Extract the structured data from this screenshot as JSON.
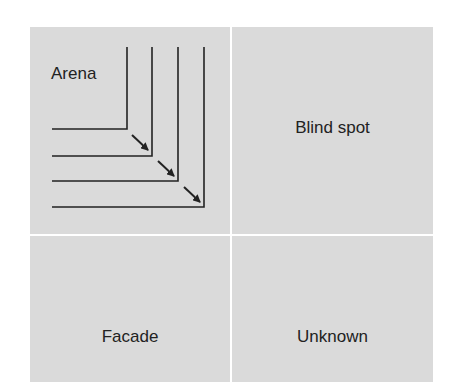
{
  "diagram": {
    "quadrants": [
      {
        "id": "arena",
        "label": "Arena",
        "position": "top-left",
        "note": "Expanding nested L-shaped boundaries with arrows pointing outward (down-right)"
      },
      {
        "id": "blind_spot",
        "label": "Blind spot",
        "position": "top-right"
      },
      {
        "id": "facade",
        "label": "Facade",
        "position": "bottom-left"
      },
      {
        "id": "unknown",
        "label": "Unknown",
        "position": "bottom-right"
      }
    ],
    "arena_boundaries": 4,
    "arena_arrows": 3,
    "colors": {
      "quadrant_fill": "#dadada",
      "divider": "#ffffff",
      "line": "#222222",
      "text": "#222222"
    }
  }
}
